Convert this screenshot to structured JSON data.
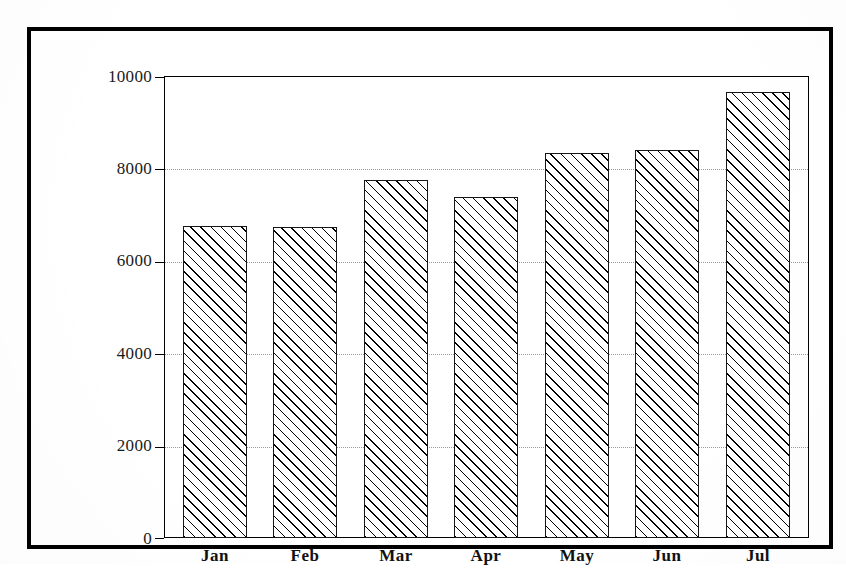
{
  "chart_data": {
    "type": "bar",
    "title": "",
    "subtitle": "",
    "xlabel": "",
    "ylabel": "",
    "categories": [
      "Jan",
      "Feb",
      "Mar",
      "Apr",
      "May",
      "Jun",
      "Jul"
    ],
    "values": [
      6760,
      6740,
      7760,
      7390,
      8330,
      8390,
      9650
    ],
    "series": [
      {
        "name": "Monthly total",
        "values": [
          6760,
          6740,
          7760,
          7390,
          8330,
          8390,
          9650
        ]
      }
    ],
    "ylim": [
      0,
      10000
    ],
    "ytick_labels": [
      "0",
      "2000",
      "4000",
      "6000",
      "8000",
      "10000"
    ],
    "ytick_values": [
      0,
      2000,
      4000,
      6000,
      8000,
      10000
    ],
    "xtick_labels": [
      "Jan",
      "Feb",
      "Mar",
      "Apr",
      "May",
      "Jun",
      "Jul"
    ],
    "grid": true,
    "grid_axis": "y",
    "grid_style": "dotted",
    "legend": false,
    "legend_position": "none",
    "bar_fill": "diagonal-hatch",
    "bar_edge_color": "#161616",
    "bar_face_color": "#ffffff",
    "annotations": []
  },
  "figure": {
    "frame_color": "#000000",
    "background_color": "#ffffff",
    "axis_color": "#000000",
    "gridline_color": "#9a9a9a"
  }
}
